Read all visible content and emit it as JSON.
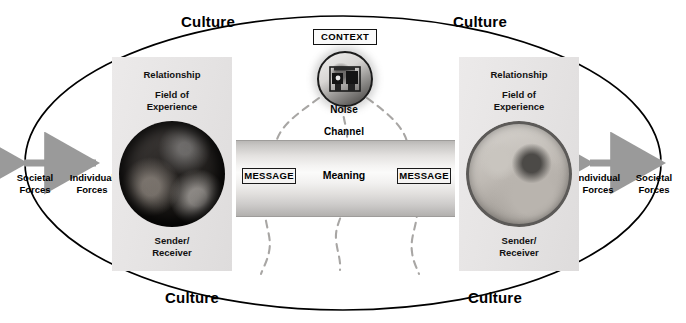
{
  "figure": {
    "background_color": "#ffffff",
    "ellipse_stroke": "#000000",
    "arrow_color": "#8e8e8e",
    "noise_line_color": "#a8a6a4"
  },
  "culture_labels": {
    "top_left": "Culture",
    "top_right": "Culture",
    "bottom_left": "Culture",
    "bottom_right": "Culture"
  },
  "forces": {
    "left": {
      "outer_label_line1": "Societal",
      "outer_label_line2": "Forces",
      "inner_label_line1": "Individual",
      "inner_label_line2": "Forces"
    },
    "right": {
      "inner_label_line1": "Individual",
      "inner_label_line2": "Forces",
      "outer_label_line1": "Societal",
      "outer_label_line2": "Forces"
    }
  },
  "left_participant": {
    "relationship_label": "Relationship",
    "field_line1": "Field of",
    "field_line2": "Experience",
    "role_line1": "Sender/",
    "role_line2": "Receiver",
    "photo_alt": "person-photographing-group"
  },
  "right_participant": {
    "relationship_label": "Relationship",
    "field_line1": "Field of",
    "field_line2": "Experience",
    "role_line1": "Sender/",
    "role_line2": "Receiver",
    "photo_alt": "two-people-one-on-phone"
  },
  "center": {
    "context_label": "CONTEXT",
    "noise_label": "Noise",
    "noise_icon_alt": "generator-machine",
    "channel_label": "Channel",
    "message_left": "MESSAGE",
    "message_right": "MESSAGE",
    "meaning_label": "Meaning"
  }
}
